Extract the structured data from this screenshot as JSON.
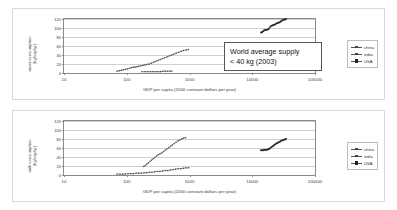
{
  "chart_data": [
    {
      "type": "scatter",
      "id": "meat",
      "title": "",
      "xlabel": "GDP per capita (2000 constant dollars per year)",
      "ylabel": "meat consumption (kg/cap/yr)",
      "ylabel_lines": [
        "meat consumption",
        "(kg/cap/yr)"
      ],
      "xscale": "log",
      "xlim": [
        10,
        100000
      ],
      "ylim": [
        0,
        120
      ],
      "xticks": [
        "10",
        "100",
        "1000",
        "10000",
        "100000"
      ],
      "yticks": [
        "0",
        "20",
        "40",
        "60",
        "80",
        "100",
        "120"
      ],
      "grid": true,
      "legend_position": "right",
      "annotation": {
        "line1": "World average supply",
        "line2": "< 40 kg (2003)"
      },
      "series": [
        {
          "name": "china",
          "points": [
            [
              70,
              4
            ],
            [
              76,
              5
            ],
            [
              82,
              6
            ],
            [
              88,
              7
            ],
            [
              95,
              8
            ],
            [
              103,
              9
            ],
            [
              112,
              11
            ],
            [
              120,
              12
            ],
            [
              128,
              13
            ],
            [
              136,
              13
            ],
            [
              145,
              14
            ],
            [
              155,
              15
            ],
            [
              168,
              16
            ],
            [
              182,
              17
            ],
            [
              196,
              18
            ],
            [
              210,
              19
            ],
            [
              228,
              20
            ],
            [
              248,
              22
            ],
            [
              268,
              24
            ],
            [
              290,
              26
            ],
            [
              315,
              28
            ],
            [
              342,
              30
            ],
            [
              372,
              32
            ],
            [
              404,
              34
            ],
            [
              440,
              36
            ],
            [
              478,
              38
            ],
            [
              520,
              40
            ],
            [
              566,
              42
            ],
            [
              615,
              44
            ],
            [
              670,
              46
            ],
            [
              730,
              48
            ],
            [
              800,
              50
            ],
            [
              880,
              51
            ],
            [
              960,
              52
            ]
          ]
        },
        {
          "name": "india",
          "points": [
            [
              175,
              3
            ],
            [
              195,
              3
            ],
            [
              215,
              3
            ],
            [
              238,
              3
            ],
            [
              262,
              3
            ],
            [
              288,
              3
            ],
            [
              315,
              3
            ],
            [
              345,
              3
            ],
            [
              378,
              4
            ],
            [
              412,
              4
            ],
            [
              448,
              4
            ],
            [
              486,
              4
            ],
            [
              520,
              4
            ]
          ]
        },
        {
          "name": "USA",
          "points": [
            [
              13800,
              90
            ],
            [
              14400,
              91
            ],
            [
              15000,
              93
            ],
            [
              15600,
              95
            ],
            [
              16300,
              96
            ],
            [
              17000,
              96
            ],
            [
              17800,
              97
            ],
            [
              18600,
              99
            ],
            [
              19400,
              103
            ],
            [
              20300,
              105
            ],
            [
              21200,
              106
            ],
            [
              22100,
              107
            ],
            [
              23100,
              108
            ],
            [
              24200,
              110
            ],
            [
              25300,
              111
            ],
            [
              26400,
              112
            ],
            [
              27600,
              113
            ],
            [
              28800,
              115
            ],
            [
              30100,
              117
            ],
            [
              31500,
              118
            ],
            [
              33000,
              119
            ],
            [
              34500,
              120
            ]
          ]
        }
      ]
    },
    {
      "type": "scatter",
      "id": "milk",
      "title": "",
      "xlabel": "GDP per capita (2000 constant dollars per year)",
      "ylabel": "milk consumption (kg/cap/yr)",
      "ylabel_lines": [
        "milk consumption",
        "(kg/cap/yr)"
      ],
      "xscale": "log",
      "xlim": [
        10,
        100000
      ],
      "ylim": [
        0,
        120
      ],
      "xticks": [
        "10",
        "100",
        "1000",
        "10000",
        "100000"
      ],
      "yticks": [
        "0",
        "20",
        "40",
        "60",
        "80",
        "100",
        "120"
      ],
      "grid": true,
      "legend_position": "right",
      "series": [
        {
          "name": "china",
          "points": [
            [
              185,
              19
            ],
            [
              196,
              21
            ],
            [
              208,
              24
            ],
            [
              221,
              27
            ],
            [
              234,
              30
            ],
            [
              248,
              33
            ],
            [
              263,
              36
            ],
            [
              280,
              39
            ],
            [
              298,
              42
            ],
            [
              317,
              45
            ],
            [
              338,
              47
            ],
            [
              360,
              49
            ],
            [
              384,
              52
            ],
            [
              410,
              55
            ],
            [
              438,
              58
            ],
            [
              468,
              61
            ],
            [
              500,
              64
            ],
            [
              535,
              67
            ],
            [
              572,
              70
            ],
            [
              612,
              73
            ],
            [
              655,
              76
            ],
            [
              700,
              78
            ],
            [
              750,
              80
            ],
            [
              805,
              82
            ],
            [
              865,
              83
            ]
          ]
        },
        {
          "name": "india",
          "points": [
            [
              70,
              2
            ],
            [
              78,
              2
            ],
            [
              86,
              2
            ],
            [
              95,
              2
            ],
            [
              105,
              3
            ],
            [
              116,
              3
            ],
            [
              128,
              3
            ],
            [
              141,
              4
            ],
            [
              155,
              4
            ],
            [
              171,
              4
            ],
            [
              189,
              5
            ],
            [
              208,
              5
            ],
            [
              229,
              6
            ],
            [
              252,
              6
            ],
            [
              278,
              7
            ],
            [
              306,
              8
            ],
            [
              337,
              8
            ],
            [
              371,
              9
            ],
            [
              409,
              10
            ],
            [
              450,
              10
            ],
            [
              496,
              11
            ],
            [
              546,
              12
            ],
            [
              601,
              13
            ],
            [
              662,
              14
            ],
            [
              729,
              14
            ],
            [
              803,
              15
            ],
            [
              884,
              16
            ],
            [
              974,
              16
            ]
          ]
        },
        {
          "name": "USA",
          "points": [
            [
              13800,
              55
            ],
            [
              14400,
              55
            ],
            [
              15000,
              55
            ],
            [
              15600,
              56
            ],
            [
              16300,
              56
            ],
            [
              17000,
              56
            ],
            [
              17800,
              57
            ],
            [
              18600,
              58
            ],
            [
              19400,
              60
            ],
            [
              20300,
              62
            ],
            [
              21200,
              64
            ],
            [
              22100,
              66
            ],
            [
              23100,
              68
            ],
            [
              24200,
              70
            ],
            [
              25300,
              71
            ],
            [
              26400,
              73
            ],
            [
              27600,
              74
            ],
            [
              28800,
              76
            ],
            [
              30100,
              77
            ],
            [
              31500,
              78
            ],
            [
              33000,
              79
            ],
            [
              34500,
              80
            ]
          ]
        }
      ]
    }
  ],
  "legend": {
    "items": [
      {
        "label": "china"
      },
      {
        "label": "india"
      },
      {
        "label": "USA"
      }
    ]
  }
}
